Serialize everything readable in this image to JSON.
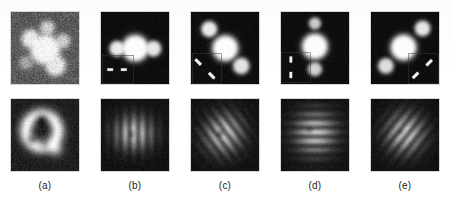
{
  "figure": {
    "background_color": "#ffffff",
    "panel_background_color": "#000000",
    "panel_border_color": "#d8d8d8",
    "caption_color": "#1b1b1b",
    "rows": 2,
    "columns": 5
  },
  "columns": [
    {
      "id": "a",
      "label": "(a)",
      "top": {
        "name": "object-image-a",
        "background": "noisy-gray",
        "noise_level": 0.34,
        "base_gray": 0.33,
        "blur": 2.1,
        "blobs": [
          {
            "cx": 0.5,
            "cy": 0.52,
            "r": 0.155,
            "amp": 1.0
          },
          {
            "cx": 0.29,
            "cy": 0.37,
            "r": 0.095,
            "amp": 0.92
          },
          {
            "cx": 0.53,
            "cy": 0.22,
            "r": 0.075,
            "amp": 0.72
          },
          {
            "cx": 0.76,
            "cy": 0.4,
            "r": 0.075,
            "amp": 0.7
          },
          {
            "cx": 0.65,
            "cy": 0.74,
            "r": 0.105,
            "amp": 0.88
          },
          {
            "cx": 0.22,
            "cy": 0.7,
            "r": 0.07,
            "amp": 0.45
          }
        ],
        "inset": null
      },
      "bottom": {
        "name": "diffraction-pattern-a",
        "pattern": "ring",
        "description": "airy-ring with dark core",
        "base_gray": 0.1,
        "noise_level": 0.16,
        "blur": 2.2,
        "ring": {
          "cx": 0.45,
          "cy": 0.44,
          "r": 0.235,
          "thickness": 0.115,
          "amp": 1.0
        },
        "core": {
          "cx": 0.45,
          "cy": 0.3,
          "r": 0.105
        },
        "extra_blobs": [
          {
            "cx": 0.3,
            "cy": 0.56,
            "r": 0.075,
            "amp": -0.55
          },
          {
            "cx": 0.5,
            "cy": 0.63,
            "r": 0.085,
            "amp": -0.4
          },
          {
            "cx": 0.66,
            "cy": 0.7,
            "r": 0.11,
            "amp": 0.55
          }
        ],
        "fringe_angle_deg": null,
        "fringe_period": null,
        "center_dot": null
      }
    },
    {
      "id": "b",
      "label": "(b)",
      "top": {
        "name": "object-image-b",
        "background": "black",
        "noise_level": 0.055,
        "base_gray": 0.045,
        "blur": 1.6,
        "blobs": [
          {
            "cx": 0.5,
            "cy": 0.5,
            "r": 0.14,
            "amp": 1.0
          },
          {
            "cx": 0.235,
            "cy": 0.505,
            "r": 0.08,
            "amp": 0.92
          },
          {
            "cx": 0.765,
            "cy": 0.505,
            "r": 0.082,
            "amp": 0.9
          }
        ],
        "inset": {
          "name": "aperture-inset-b",
          "corner": "bottom-left",
          "x": 0.015,
          "y": 0.595,
          "w": 0.455,
          "h": 0.39,
          "border_color": "#3a3a3a",
          "marks": [
            {
              "cx": 0.135,
              "cy": 0.8,
              "len": 0.085,
              "thick": 0.035,
              "angle_deg": 0
            },
            {
              "cx": 0.335,
              "cy": 0.8,
              "len": 0.085,
              "thick": 0.035,
              "angle_deg": 0
            }
          ]
        }
      },
      "bottom": {
        "name": "diffraction-pattern-b",
        "pattern": "fringes",
        "description": "vertical fringes",
        "base_gray": 0.055,
        "noise_level": 0.1,
        "blur": 2.0,
        "fringe_angle_deg": 0,
        "fringe_period": 0.255,
        "fringe_phase": 0.0,
        "envelope": {
          "cx": 0.48,
          "cy": 0.47,
          "rx": 0.4,
          "ry": 0.295
        },
        "center_dot": {
          "cx": 0.445,
          "cy": 0.485,
          "r": 0.04
        },
        "ring": null,
        "core": null,
        "extra_blobs": []
      }
    },
    {
      "id": "c",
      "label": "(c)",
      "top": {
        "name": "object-image-c",
        "background": "black",
        "noise_level": 0.055,
        "base_gray": 0.045,
        "blur": 1.6,
        "blobs": [
          {
            "cx": 0.5,
            "cy": 0.5,
            "r": 0.135,
            "amp": 1.0
          },
          {
            "cx": 0.265,
            "cy": 0.235,
            "r": 0.082,
            "amp": 0.92
          },
          {
            "cx": 0.735,
            "cy": 0.745,
            "r": 0.085,
            "amp": 0.88
          }
        ],
        "inset": {
          "name": "aperture-inset-c",
          "corner": "bottom-left",
          "x": 0.015,
          "y": 0.575,
          "w": 0.43,
          "h": 0.41,
          "border_color": "#3a3a3a",
          "marks": [
            {
              "cx": 0.105,
              "cy": 0.695,
              "len": 0.115,
              "thick": 0.04,
              "angle_deg": 45
            },
            {
              "cx": 0.305,
              "cy": 0.885,
              "len": 0.115,
              "thick": 0.04,
              "angle_deg": 45
            }
          ]
        }
      },
      "bottom": {
        "name": "diffraction-pattern-c",
        "pattern": "fringes",
        "description": "diagonal fringes tilted up-right",
        "base_gray": 0.055,
        "noise_level": 0.1,
        "blur": 2.0,
        "fringe_angle_deg": -38,
        "fringe_period": 0.245,
        "fringe_phase": 0.12,
        "envelope": {
          "cx": 0.48,
          "cy": 0.48,
          "rx": 0.4,
          "ry": 0.335
        },
        "center_dot": {
          "cx": 0.425,
          "cy": 0.48,
          "r": 0.04
        },
        "ring": null,
        "core": null,
        "extra_blobs": []
      }
    },
    {
      "id": "d",
      "label": "(d)",
      "top": {
        "name": "object-image-d",
        "background": "black",
        "noise_level": 0.055,
        "base_gray": 0.045,
        "blur": 1.6,
        "blobs": [
          {
            "cx": 0.495,
            "cy": 0.475,
            "r": 0.135,
            "amp": 1.0
          },
          {
            "cx": 0.495,
            "cy": 0.155,
            "r": 0.062,
            "amp": 0.78
          },
          {
            "cx": 0.495,
            "cy": 0.79,
            "r": 0.072,
            "amp": 0.8
          }
        ],
        "inset": {
          "name": "aperture-inset-d",
          "corner": "bottom-left",
          "x": 0.005,
          "y": 0.565,
          "w": 0.42,
          "h": 0.42,
          "border_color": "#3a3a3a",
          "marks": [
            {
              "cx": 0.145,
              "cy": 0.66,
              "len": 0.09,
              "thick": 0.038,
              "angle_deg": 90
            },
            {
              "cx": 0.145,
              "cy": 0.875,
              "len": 0.09,
              "thick": 0.038,
              "angle_deg": 90
            }
          ]
        }
      },
      "bottom": {
        "name": "diffraction-pattern-d",
        "pattern": "fringes",
        "description": "horizontal fringes",
        "base_gray": 0.055,
        "noise_level": 0.1,
        "blur": 2.1,
        "fringe_angle_deg": 90,
        "fringe_period": 0.25,
        "fringe_phase": 0.05,
        "envelope": {
          "cx": 0.5,
          "cy": 0.47,
          "rx": 0.415,
          "ry": 0.375
        },
        "center_dot": {
          "cx": 0.415,
          "cy": 0.425,
          "r": 0.038
        },
        "ring": null,
        "core": null,
        "extra_blobs": []
      }
    },
    {
      "id": "e",
      "label": "(e)",
      "top": {
        "name": "object-image-e",
        "background": "black",
        "noise_level": 0.055,
        "base_gray": 0.045,
        "blur": 1.6,
        "blobs": [
          {
            "cx": 0.475,
            "cy": 0.49,
            "r": 0.135,
            "amp": 1.0
          },
          {
            "cx": 0.755,
            "cy": 0.225,
            "r": 0.08,
            "amp": 0.9
          },
          {
            "cx": 0.215,
            "cy": 0.745,
            "r": 0.08,
            "amp": 0.86
          }
        ],
        "inset": {
          "name": "aperture-inset-e",
          "corner": "bottom-right",
          "x": 0.545,
          "y": 0.575,
          "w": 0.44,
          "h": 0.41,
          "border_color": "#3a3a3a",
          "marks": [
            {
              "cx": 0.655,
              "cy": 0.88,
              "len": 0.115,
              "thick": 0.04,
              "angle_deg": -45
            },
            {
              "cx": 0.855,
              "cy": 0.705,
              "len": 0.115,
              "thick": 0.04,
              "angle_deg": -45
            }
          ]
        }
      },
      "bottom": {
        "name": "diffraction-pattern-e",
        "pattern": "fringes",
        "description": "diagonal fringes tilted up-left",
        "base_gray": 0.055,
        "noise_level": 0.1,
        "blur": 2.0,
        "fringe_angle_deg": 40,
        "fringe_period": 0.25,
        "fringe_phase": 0.1,
        "envelope": {
          "cx": 0.5,
          "cy": 0.475,
          "rx": 0.385,
          "ry": 0.345
        },
        "center_dot": {
          "cx": 0.425,
          "cy": 0.45,
          "r": 0.042
        },
        "ring": null,
        "core": null,
        "extra_blobs": []
      }
    }
  ]
}
